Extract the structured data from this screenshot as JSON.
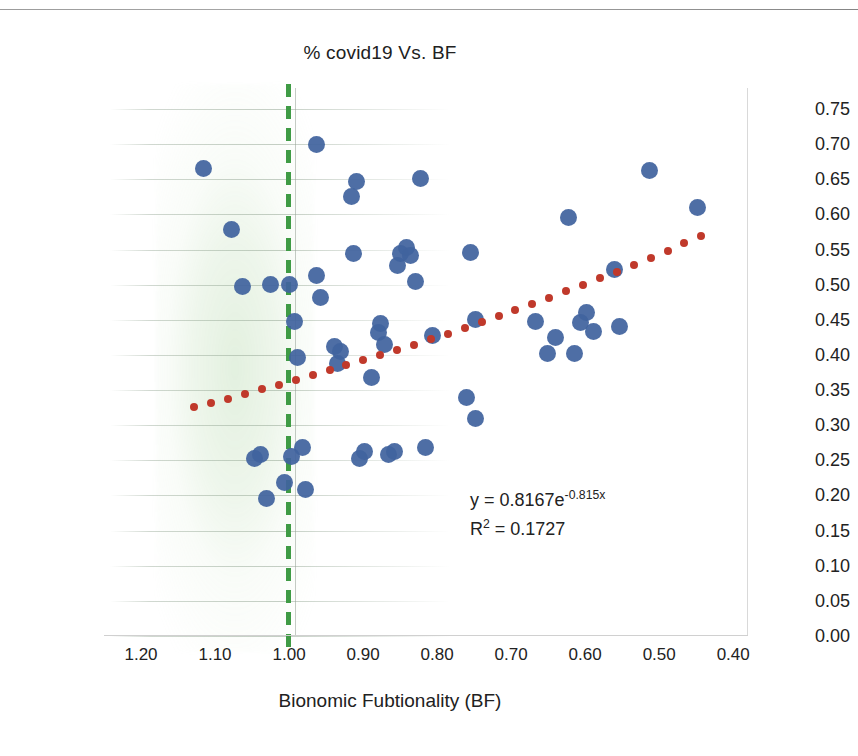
{
  "chart_data": {
    "type": "scatter",
    "title": "% covid19 Vs. BF",
    "xlabel": "Bionomic Fubtionality (BF)",
    "ylabel": "",
    "xlim": [
      1.25,
      0.38
    ],
    "ylim": [
      0.0,
      0.78
    ],
    "x_ticks": [
      "1.20",
      "1.10",
      "1.00",
      "0.90",
      "0.80",
      "0.70",
      "0.60",
      "0.50",
      "0.40"
    ],
    "x_tick_values": [
      1.2,
      1.1,
      1.0,
      0.9,
      0.8,
      0.7,
      0.6,
      0.5,
      0.4
    ],
    "y_ticks": [
      "0.75",
      "0.70",
      "0.65",
      "0.60",
      "0.55",
      "0.50",
      "0.45",
      "0.40",
      "0.35",
      "0.30",
      "0.25",
      "0.20",
      "0.15",
      "0.10",
      "0.05",
      "0.00"
    ],
    "y_tick_values": [
      0.75,
      0.7,
      0.65,
      0.6,
      0.55,
      0.5,
      0.45,
      0.4,
      0.35,
      0.3,
      0.25,
      0.2,
      0.15,
      0.1,
      0.05,
      0.0
    ],
    "x_axis_reversed": true,
    "y_axis_position": "right",
    "grid": "horizontal-partial",
    "legend": "none",
    "marker_color": "#41639e",
    "trendline_color": "#c0392b",
    "reference_line_color": "#3f9b45",
    "reference_line_value": 1.0,
    "reference_line_style": "dashed",
    "annotations": {
      "equation_base": "y = 0.8167e",
      "equation_exponent": "-0.815x",
      "r_squared_prefix": "R",
      "r_squared_sup": "2",
      "r_squared_value": " = 0.1727",
      "equation_full": "y = 0.8167e^-0.815x",
      "r_squared_full": "R² = 0.1727"
    },
    "series": [
      {
        "name": "% covid19",
        "points": [
          [
            1.115,
            0.665
          ],
          [
            1.078,
            0.578
          ],
          [
            1.063,
            0.497
          ],
          [
            1.025,
            0.5
          ],
          [
            1.038,
            0.258
          ],
          [
            1.047,
            0.252
          ],
          [
            1.03,
            0.196
          ],
          [
            1.006,
            0.218
          ],
          [
            1.0,
            0.5
          ],
          [
            0.997,
            0.255
          ],
          [
            0.993,
            0.448
          ],
          [
            0.988,
            0.396
          ],
          [
            0.982,
            0.269
          ],
          [
            0.978,
            0.208
          ],
          [
            0.963,
            0.7
          ],
          [
            0.958,
            0.482
          ],
          [
            0.963,
            0.513
          ],
          [
            0.938,
            0.412
          ],
          [
            0.931,
            0.405
          ],
          [
            0.934,
            0.388
          ],
          [
            0.916,
            0.625
          ],
          [
            0.909,
            0.647
          ],
          [
            0.913,
            0.545
          ],
          [
            0.905,
            0.252
          ],
          [
            0.898,
            0.262
          ],
          [
            0.888,
            0.368
          ],
          [
            0.879,
            0.432
          ],
          [
            0.876,
            0.445
          ],
          [
            0.871,
            0.415
          ],
          [
            0.866,
            0.259
          ],
          [
            0.858,
            0.262
          ],
          [
            0.853,
            0.527
          ],
          [
            0.849,
            0.545
          ],
          [
            0.841,
            0.553
          ],
          [
            0.836,
            0.541
          ],
          [
            0.829,
            0.505
          ],
          [
            0.822,
            0.651
          ],
          [
            0.816,
            0.268
          ],
          [
            0.806,
            0.428
          ],
          [
            0.76,
            0.34
          ],
          [
            0.755,
            0.546
          ],
          [
            0.748,
            0.309
          ],
          [
            0.748,
            0.451
          ],
          [
            0.667,
            0.447
          ],
          [
            0.651,
            0.402
          ],
          [
            0.64,
            0.425
          ],
          [
            0.623,
            0.595
          ],
          [
            0.614,
            0.402
          ],
          [
            0.606,
            0.446
          ],
          [
            0.598,
            0.46
          ],
          [
            0.589,
            0.433
          ],
          [
            0.56,
            0.522
          ],
          [
            0.554,
            0.441
          ],
          [
            0.513,
            0.662
          ],
          [
            0.448,
            0.61
          ]
        ]
      }
    ],
    "trendline": {
      "name": "Exponential trendline",
      "equation": "y = 0.8167e^-0.815x",
      "r_squared": 0.1727,
      "style": "dotted",
      "x_start": 1.128,
      "x_end": 0.443,
      "y_start": 0.328,
      "y_end": 0.572
    }
  }
}
